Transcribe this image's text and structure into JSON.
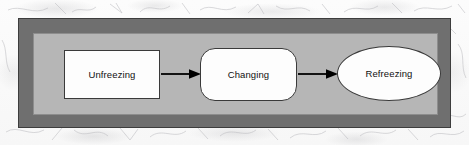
{
  "figure": {
    "frame": {
      "outer_border_color": "#6f6f6f",
      "inner_panel_color": "#b6b6b6"
    },
    "nodes": [
      {
        "id": "unfreezing",
        "label": "Unfreezing",
        "shape": "rectangle"
      },
      {
        "id": "changing",
        "label": "Changing",
        "shape": "rounded-rectangle"
      },
      {
        "id": "refreezing",
        "label": "Refreezing",
        "shape": "ellipse"
      }
    ],
    "connectors": [
      {
        "id": "arrow-1",
        "from": "unfreezing",
        "to": "changing",
        "style": "solid-arrow",
        "color": "#000000"
      },
      {
        "id": "arrow-2",
        "from": "changing",
        "to": "refreezing",
        "style": "solid-arrow",
        "color": "#000000"
      }
    ]
  }
}
